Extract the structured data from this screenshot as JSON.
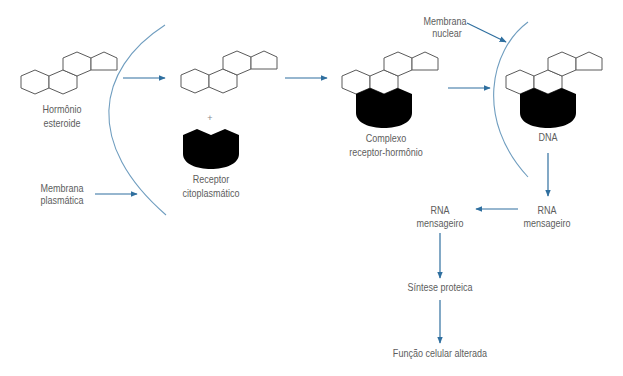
{
  "diagram": {
    "colors": {
      "arrow": "#2f6f9f",
      "membrane": "#6f9dbf",
      "structure_outline": "#5a5a5a",
      "receptor_fill": "#000000",
      "label_text": "#5d5d5d"
    },
    "nodes": {
      "hormone": {
        "line1": "Hormônio",
        "line2": "esteroide"
      },
      "plus": "+",
      "receptor": {
        "line1": "Receptor",
        "line2": "citoplasmático"
      },
      "complex": {
        "line1": "Complexo",
        "line2": "receptor-hormônio"
      },
      "dna": "DNA",
      "rna_nucleus": {
        "line1": "RNA",
        "line2": "mensageiro"
      },
      "rna_cytoplasm": {
        "line1": "RNA",
        "line2": "mensageiro"
      },
      "protein_synthesis": "Síntese proteica",
      "cell_function": "Função celular alterada"
    },
    "membranes": {
      "plasma": {
        "line1": "Membrana",
        "line2": "plasmática"
      },
      "nuclear": {
        "line1": "Membrana",
        "line2": "nuclear"
      }
    },
    "flow": [
      "Hormônio esteroide → (atravessa membrana plasmática) → Hormônio + Receptor citoplasmático",
      "→ Complexo receptor-hormônio",
      "→ (atravessa membrana nuclear) → DNA",
      "→ RNA mensageiro (núcleo) → RNA mensageiro (citoplasma)",
      "→ Síntese proteica → Função celular alterada"
    ]
  }
}
